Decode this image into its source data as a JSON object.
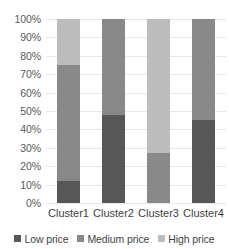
{
  "chart_data": {
    "type": "bar",
    "subtype": "stacked-percent",
    "title": "",
    "xlabel": "",
    "ylabel": "",
    "ylim": [
      0,
      100
    ],
    "grid": true,
    "legend_position": "bottom",
    "categories": [
      "Cluster1",
      "Cluster2",
      "Cluster3",
      "Cluster4"
    ],
    "ytick_labels": [
      "0%",
      "10%",
      "20%",
      "30%",
      "40%",
      "50%",
      "60%",
      "70%",
      "80%",
      "90%",
      "100%"
    ],
    "ytick_values": [
      0,
      10,
      20,
      30,
      40,
      50,
      60,
      70,
      80,
      90,
      100
    ],
    "series": [
      {
        "name": "Low price",
        "color": "#575757",
        "values": [
          12,
          48,
          0,
          45
        ]
      },
      {
        "name": "Medium price",
        "color": "#898989",
        "values": [
          63,
          52,
          27,
          55
        ]
      },
      {
        "name": "High price",
        "color": "#bcbcbc",
        "values": [
          25,
          0,
          73,
          0
        ]
      }
    ]
  }
}
